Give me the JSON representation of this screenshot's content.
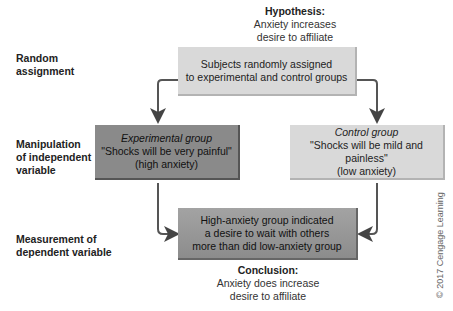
{
  "hypothesis": {
    "title": "Hypothesis:",
    "line1": "Anxiety increases",
    "line2": "desire to affiliate"
  },
  "stages": [
    {
      "line1": "Random",
      "line2": "assignment"
    },
    {
      "line1": "Manipulation",
      "line2": "of independent",
      "line3": "variable"
    },
    {
      "line1": "Measurement of",
      "line2": "dependent variable"
    }
  ],
  "assignment_box": {
    "line1": "Subjects randomly assigned",
    "line2": "to experimental and control groups"
  },
  "experimental_box": {
    "title": "Experimental group",
    "line1": "\"Shocks will be very painful\"",
    "line2": "(high anxiety)"
  },
  "control_box": {
    "title": "Control group",
    "line1": "\"Shocks will be mild and painless\"",
    "line2": "(low anxiety)"
  },
  "result_box": {
    "line1": "High-anxiety group indicated",
    "line2": "a desire to wait with others",
    "line3": "more than did low-anxiety group"
  },
  "conclusion": {
    "title": "Conclusion:",
    "line1": "Anxiety does increase",
    "line2": "desire to affiliate"
  },
  "copyright": "© 2017 Cengage Learning",
  "colors": {
    "light_box": "#d9d9d9",
    "dark_box": "#8a8a8a",
    "arrow": "#555555"
  }
}
